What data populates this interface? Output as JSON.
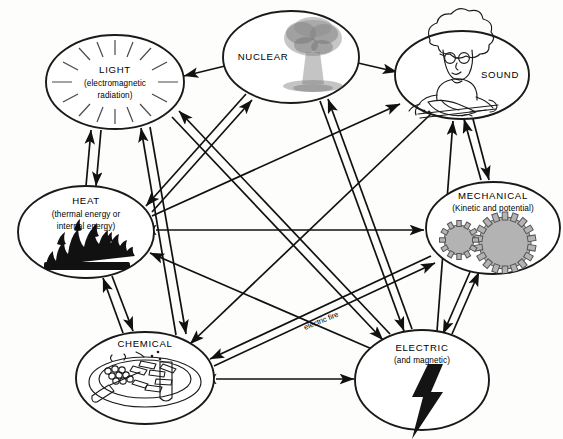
{
  "diagram": {
    "background_color": "#fdfdfc",
    "line_color": "#111111",
    "nodes": [
      {
        "id": "light",
        "label": "LIGHT",
        "sub_line_1": "(electromagnetic",
        "sub_line_2": "radiation)",
        "icon": "radiating-rays-icon",
        "cx": 115,
        "cy": 82,
        "rx": 70,
        "ry": 48
      },
      {
        "id": "nuclear",
        "label": "NUCLEAR",
        "sub_line_1": "",
        "sub_line_2": "",
        "icon": "mushroom-cloud-icon",
        "cx": 291,
        "cy": 57,
        "rx": 69,
        "ry": 47
      },
      {
        "id": "sound",
        "label": "SOUND",
        "sub_line_1": "",
        "sub_line_2": "",
        "icon": "violinist-icon",
        "cx": 462,
        "cy": 75,
        "rx": 68,
        "ry": 45
      },
      {
        "id": "heat",
        "label": "HEAT",
        "sub_line_1": "(thermal energy or",
        "sub_line_2": "internal energy)",
        "icon": "flame-icon",
        "cx": 86,
        "cy": 232,
        "rx": 69,
        "ry": 47
      },
      {
        "id": "mechanical",
        "label": "MECHANICAL",
        "sub_line_1": "(Kinetic and potential)",
        "sub_line_2": "",
        "icon": "gears-icon",
        "cx": 493,
        "cy": 228,
        "rx": 68,
        "ry": 47
      },
      {
        "id": "chemical",
        "label": "CHEMICAL",
        "sub_line_1": "",
        "sub_line_2": "",
        "icon": "plate-of-food-icon",
        "cx": 145,
        "cy": 378,
        "rx": 70,
        "ry": 47
      },
      {
        "id": "electric",
        "label": "ELECTRIC",
        "sub_line_1": "(and magnetic)",
        "sub_line_2": "",
        "icon": "lightning-bolt-icon",
        "cx": 422,
        "cy": 380,
        "rx": 67,
        "ry": 50
      }
    ],
    "edges": [
      {
        "id": "nuclear-to-light",
        "from": "nuclear",
        "to": "light",
        "direction": "one-way",
        "label": ""
      },
      {
        "id": "nuclear-to-sound",
        "from": "nuclear",
        "to": "sound",
        "direction": "one-way",
        "label": ""
      },
      {
        "id": "light-heat",
        "from": "light",
        "to": "heat",
        "direction": "two-way",
        "label": ""
      },
      {
        "id": "light-chemical",
        "from": "light",
        "to": "chemical",
        "direction": "two-way",
        "label": ""
      },
      {
        "id": "light-electric",
        "from": "light",
        "to": "electric",
        "direction": "two-way",
        "label": ""
      },
      {
        "id": "nuclear-heat",
        "from": "nuclear",
        "to": "heat",
        "direction": "two-way",
        "label": ""
      },
      {
        "id": "nuclear-electric",
        "from": "nuclear",
        "to": "electric",
        "direction": "two-way",
        "label": ""
      },
      {
        "id": "heat-mechanical",
        "from": "heat",
        "to": "mechanical",
        "direction": "two-way",
        "label": ""
      },
      {
        "id": "heat-chemical",
        "from": "heat",
        "to": "chemical",
        "direction": "two-way",
        "label": ""
      },
      {
        "id": "heat-sound",
        "from": "heat",
        "to": "sound",
        "direction": "one-way",
        "label": ""
      },
      {
        "id": "electric-heat",
        "from": "electric",
        "to": "heat",
        "direction": "one-way",
        "label": "electric fire"
      },
      {
        "id": "sound-mechanical",
        "from": "sound",
        "to": "mechanical",
        "direction": "two-way",
        "label": ""
      },
      {
        "id": "sound-chemical",
        "from": "sound",
        "to": "chemical",
        "direction": "one-way",
        "label": ""
      },
      {
        "id": "mechanical-chemical",
        "from": "mechanical",
        "to": "chemical",
        "direction": "two-way",
        "label": ""
      },
      {
        "id": "mechanical-electric",
        "from": "mechanical",
        "to": "electric",
        "direction": "two-way",
        "label": ""
      },
      {
        "id": "chemical-electric",
        "from": "chemical",
        "to": "electric",
        "direction": "two-way",
        "label": ""
      },
      {
        "id": "electric-sound",
        "from": "electric",
        "to": "sound",
        "direction": "one-way",
        "label": ""
      }
    ],
    "edge_labels": [
      {
        "id": "electric-fire-label",
        "text": "electric fire",
        "x": 305,
        "y": 330,
        "rotation": -22
      }
    ]
  }
}
